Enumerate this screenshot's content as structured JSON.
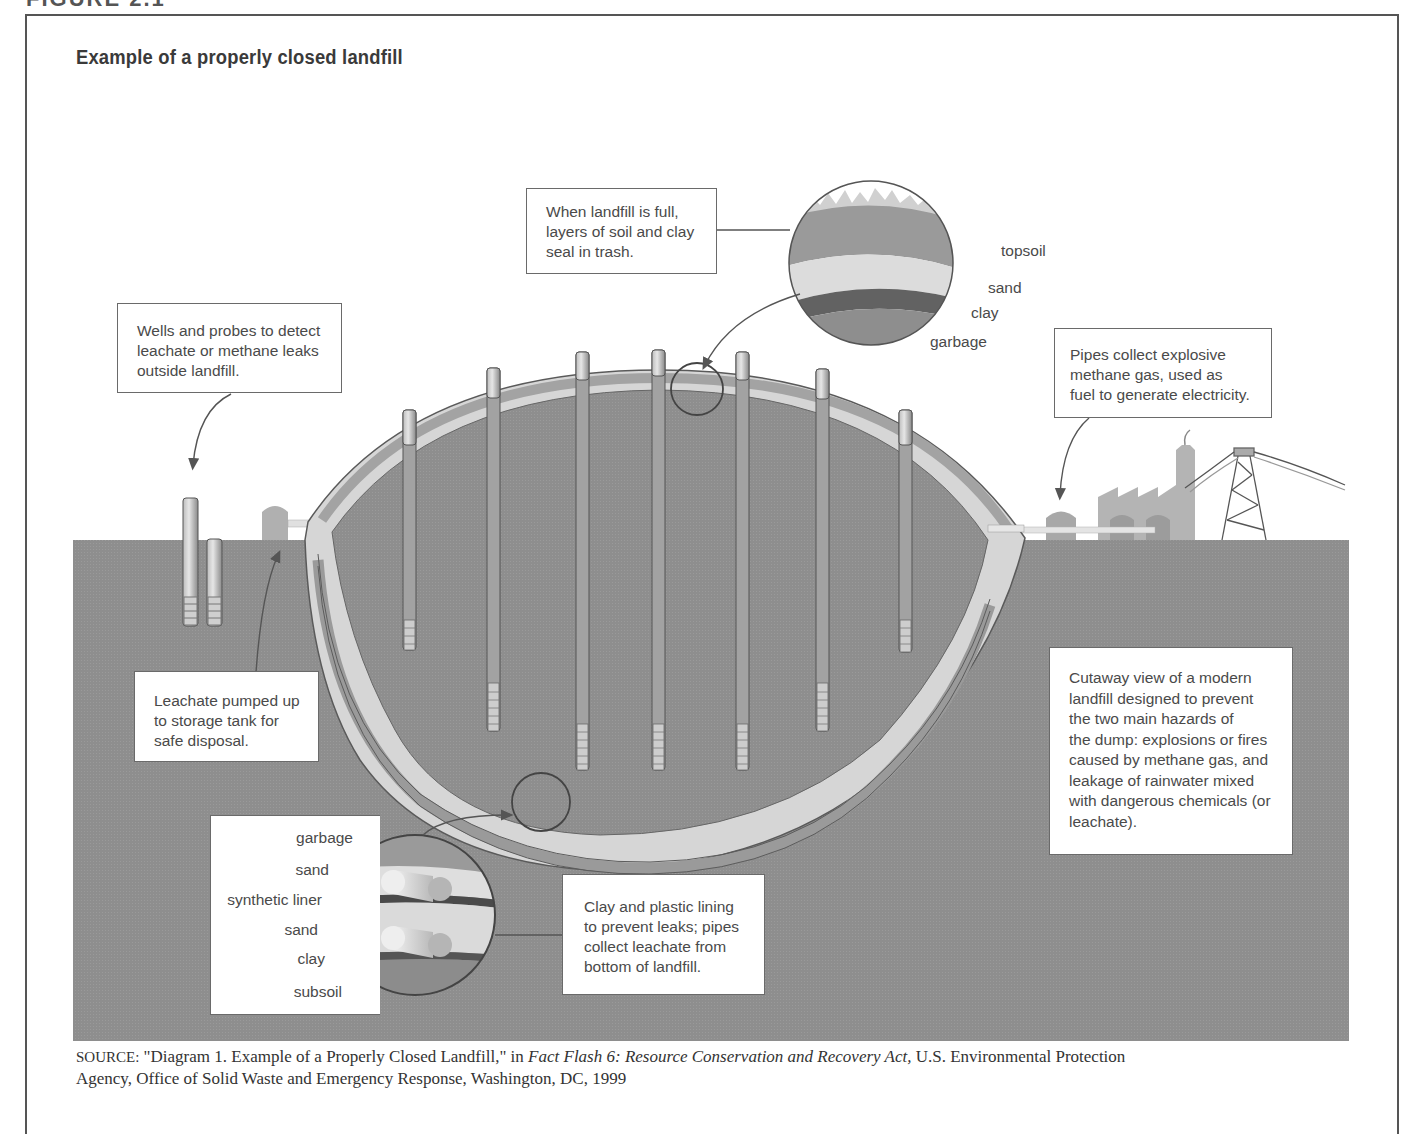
{
  "figure": {
    "header_fragment": "FIGURE 2.1",
    "title": "Example of a properly closed landfill"
  },
  "callouts": {
    "top_seal": {
      "text": "When landfill is full,\nlayers of soil and clay\nseal in trash."
    },
    "wells": {
      "text": "Wells and probes to detect\nleachate or methane leaks\noutside landfill."
    },
    "methane": {
      "text": "Pipes collect explosive\nmethane gas, used as\nfuel to generate electricity."
    },
    "leachate": {
      "text": "Leachate pumped up\nto storage tank for\nsafe disposal."
    },
    "cutaway": {
      "text": "Cutaway view of a modern\nlandfill designed to prevent\nthe two main hazards of\nthe dump: explosions or fires\ncaused by methane gas, and\nleakage of rainwater mixed\nwith dangerous chemicals (or\nleachate)."
    },
    "lining": {
      "text": "Clay and plastic lining\nto prevent leaks; pipes\ncollect leachate from\nbottom of landfill."
    }
  },
  "top_layers": {
    "labels": [
      "topsoil",
      "sand",
      "clay",
      "garbage"
    ]
  },
  "bottom_layers": {
    "labels": [
      "garbage",
      "sand",
      "synthetic liner",
      "sand",
      "clay",
      "subsoil"
    ]
  },
  "source": {
    "prefix": "SOURCE:",
    "quote": " \"Diagram 1. Example of a Properly Closed Landfill,\" in ",
    "publication": "Fact Flash 6: Resource Conservation and Recovery Act,",
    "rest_line1": " U.S. Environmental Protection",
    "rest_line2": "Agency, Office of Solid Waste and Emergency Response, Washington, DC, 1999"
  },
  "colors": {
    "ground": "#8c8c8c",
    "garbage": "#8f8f8f",
    "sand": "#d9d9d9",
    "clay": "#6e6e6e",
    "liner_mid": "#a8a8a8",
    "outline": "#5a5a5a",
    "paper": "#ffffff",
    "text": "#4a4a4a"
  }
}
